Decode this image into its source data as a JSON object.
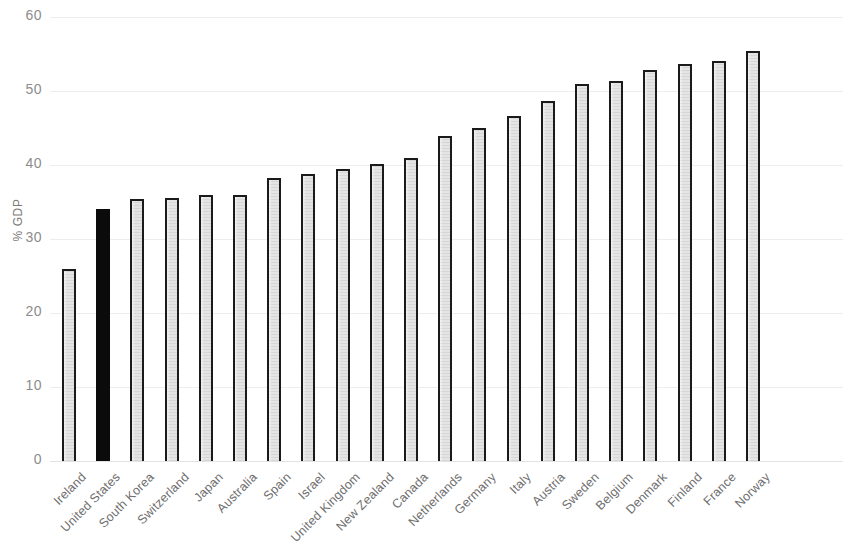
{
  "chart_data": {
    "type": "bar",
    "title": "",
    "subtitle": "",
    "xlabel": "",
    "ylabel": "% GDP",
    "ylim": [
      0,
      60
    ],
    "ytick_labels": [
      "60",
      "50",
      "40",
      "30",
      "20",
      "10",
      "0"
    ],
    "yticks": [
      60,
      50,
      40,
      30,
      20,
      10,
      0
    ],
    "grid": true,
    "legend": false,
    "orientation": "vertical",
    "highlight_category": "United States",
    "categories": [
      "Ireland",
      "United States",
      "South Korea",
      "Switzerland",
      "Japan",
      "Australia",
      "Spain",
      "Israel",
      "United Kingdom",
      "New Zealand",
      "Canada",
      "Netherlands",
      "Germany",
      "Italy",
      "Austria",
      "Sweden",
      "Belgium",
      "Denmark",
      "Finland",
      "France",
      "Norway"
    ],
    "values": [
      26.0,
      34.1,
      35.4,
      35.5,
      36.0,
      36.0,
      38.2,
      38.8,
      39.4,
      40.2,
      41.0,
      43.9,
      45.0,
      46.6,
      48.7,
      51.0,
      51.4,
      52.8,
      53.6,
      54.0,
      55.4
    ],
    "colors": {
      "bar_fill": "#e4e4e4",
      "bar_border": "#1a1a1a",
      "highlight_fill": "#0b0b0b",
      "gridline": "#ededed",
      "tick_text": "#8c8c8c",
      "axis_title": "#7a7a7a",
      "background": "#ffffff"
    }
  }
}
